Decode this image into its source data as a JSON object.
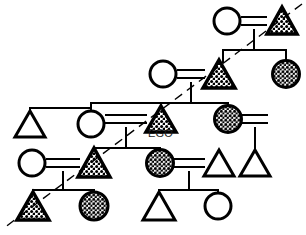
{
  "diagram": {
    "type": "genealogical-kinship-diagram",
    "width": 306,
    "height": 235,
    "background_color": "#ffffff",
    "line_color": "#000000",
    "fill_pattern_color": "#000000",
    "labels": {
      "ego": "EGO"
    },
    "legend_semantics": {
      "triangle": "male",
      "circle": "female",
      "filled_triangle": "male-marked-lineage",
      "filled_circle": "female-marked-lineage",
      "double_line": "marriage",
      "vertical_line": "descent",
      "horizontal_bracket": "sibling-set",
      "dashed_diagonal": "lineage-division-axis"
    },
    "dashed_axis": {
      "x1": 302,
      "y1": 4,
      "x2": 4,
      "y2": 228
    },
    "nodes": [
      {
        "id": "n1",
        "shape": "circle",
        "fill": "none",
        "cx": 227,
        "cy": 21,
        "r": 13,
        "row": 1
      },
      {
        "id": "n2",
        "shape": "triangle",
        "fill": "stipple",
        "cx": 282,
        "cy": 21,
        "size": 28,
        "row": 1
      },
      {
        "id": "n3",
        "shape": "circle",
        "fill": "none",
        "cx": 163,
        "cy": 74,
        "r": 13,
        "row": 2
      },
      {
        "id": "n4",
        "shape": "triangle",
        "fill": "stipple",
        "cx": 219,
        "cy": 74,
        "size": 28,
        "row": 2
      },
      {
        "id": "n5",
        "shape": "circle",
        "fill": "stipple",
        "cx": 286,
        "cy": 74,
        "r": 13,
        "row": 2
      },
      {
        "id": "n6",
        "shape": "triangle",
        "fill": "none",
        "cx": 30,
        "cy": 124,
        "size": 28,
        "row": 3
      },
      {
        "id": "n7",
        "shape": "circle",
        "fill": "none",
        "cx": 91,
        "cy": 124,
        "r": 13,
        "row": 3
      },
      {
        "id": "n8",
        "shape": "triangle",
        "fill": "stipple",
        "cx": 161,
        "cy": 119,
        "size": 28,
        "row": 3,
        "label": "EGO"
      },
      {
        "id": "n9",
        "shape": "circle",
        "fill": "stipple",
        "cx": 228,
        "cy": 119,
        "r": 13,
        "row": 3
      },
      {
        "id": "n10",
        "shape": "circle",
        "fill": "none",
        "cx": 32,
        "cy": 163,
        "r": 13,
        "row": 4
      },
      {
        "id": "n11",
        "shape": "triangle",
        "fill": "stipple",
        "cx": 94,
        "cy": 163,
        "size": 30,
        "row": 4
      },
      {
        "id": "n12",
        "shape": "circle",
        "fill": "stipple",
        "cx": 160,
        "cy": 163,
        "r": 13,
        "row": 4
      },
      {
        "id": "n13",
        "shape": "triangle",
        "fill": "none",
        "cx": 219,
        "cy": 163,
        "size": 28,
        "row": 4
      },
      {
        "id": "n14",
        "shape": "triangle",
        "fill": "none",
        "cx": 255,
        "cy": 163,
        "size": 28,
        "row": 4
      },
      {
        "id": "n15",
        "shape": "triangle",
        "fill": "stipple",
        "cx": 33,
        "cy": 206,
        "size": 30,
        "row": 5
      },
      {
        "id": "n16",
        "shape": "circle",
        "fill": "stipple",
        "cx": 94,
        "cy": 206,
        "r": 14,
        "row": 5
      },
      {
        "id": "n17",
        "shape": "triangle",
        "fill": "none",
        "cx": 159,
        "cy": 206,
        "size": 30,
        "row": 5
      },
      {
        "id": "n18",
        "shape": "circle",
        "fill": "none",
        "cx": 218,
        "cy": 206,
        "r": 13,
        "row": 5
      }
    ],
    "marriages": [
      {
        "id": "m1",
        "spouse_a": "n1",
        "spouse_b": "n2",
        "y": 21,
        "x1": 242,
        "x2": 266,
        "descent_x": 254,
        "descent_y2": 50
      },
      {
        "id": "m2",
        "spouse_a": "n3",
        "spouse_b": "n4",
        "y": 74,
        "x1": 178,
        "x2": 204,
        "descent_x": 191,
        "descent_y2": 103
      },
      {
        "id": "m3",
        "spouse_a": "n7",
        "spouse_b": "n8",
        "y": 119,
        "x1": 106,
        "x2": 146,
        "descent_x": 126,
        "descent_y2": 148
      },
      {
        "id": "m4",
        "spouse_a": "n10",
        "spouse_b": "n11",
        "y": 163,
        "x1": 47,
        "x2": 79,
        "descent_x": 63,
        "descent_y2": 190
      },
      {
        "id": "m5",
        "spouse_a": "n12",
        "spouse_b": "n13",
        "y": 163,
        "x1": 175,
        "x2": 204,
        "descent_x": 189,
        "descent_y2": 190
      },
      {
        "id": "m6",
        "spouse_a": "n9",
        "spouse_b": "n14",
        "y": 119,
        "x1": 243,
        "x2": 240,
        "descent_x": 255,
        "descent_y2": 148
      }
    ],
    "sibling_brackets": [
      {
        "id": "s1",
        "y": 50,
        "x_left": 223,
        "x_right": 286,
        "children_x": [
          223,
          286
        ],
        "parent_x": 254
      },
      {
        "id": "s2",
        "y": 103,
        "x_left": 91,
        "x_right": 228,
        "children_x": [
          91,
          161,
          228
        ],
        "parent_x": 191
      },
      {
        "id": "s3",
        "y": 148,
        "x_left": 94,
        "x_right": 160,
        "children_x": [
          94,
          160
        ],
        "parent_x": 126
      },
      {
        "id": "s4",
        "y": 190,
        "x_left": 33,
        "x_right": 94,
        "children_x": [
          33,
          94
        ],
        "parent_x": 63
      },
      {
        "id": "s5",
        "y": 190,
        "x_left": 159,
        "x_right": 218,
        "children_x": [
          159,
          218
        ],
        "parent_x": 189
      }
    ]
  }
}
